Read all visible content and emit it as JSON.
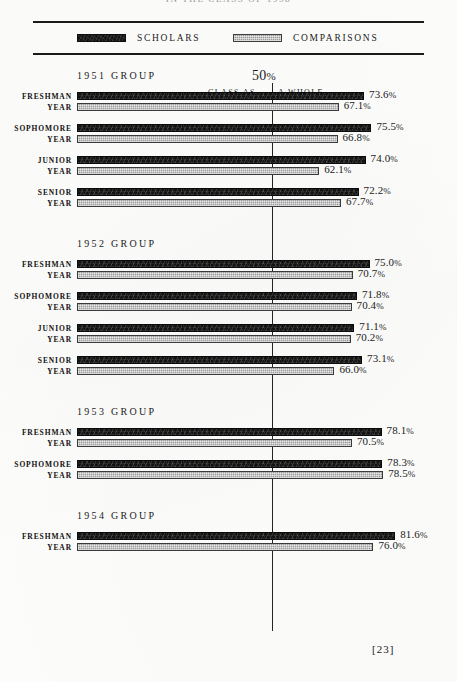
{
  "page": {
    "running_title": "IN THE CLASS OF 1958",
    "folio": "[23]"
  },
  "legend": {
    "scholars_label": "SCHOLARS",
    "comparisons_label": "COMPARISONS",
    "scholars_color": "#131313",
    "comparisons_color": "#9c9c9c"
  },
  "reference": {
    "value_text": "50",
    "percent_sign": "%",
    "left_label": "CLASS AS",
    "right_label": "A WHOLE",
    "value": 50
  },
  "chart_data": {
    "type": "bar",
    "orientation": "horizontal",
    "title": "IN THE CLASS OF 1958",
    "xlabel": "",
    "ylabel": "",
    "xlim": [
      0,
      100
    ],
    "grid": false,
    "legend_position": "top",
    "reference_line": {
      "value": 50,
      "label": "50% CLASS AS A WHOLE"
    },
    "series": [
      {
        "name": "SCHOLARS",
        "color": "#131313"
      },
      {
        "name": "COMPARISONS",
        "color": "#9c9c9c"
      }
    ],
    "groups": [
      {
        "heading": "1951 GROUP",
        "rows": [
          {
            "label_line1": "FRESHMAN",
            "label_line2": "YEAR",
            "scholars": 73.6,
            "comparisons": 67.1,
            "scholars_text": "73.6",
            "comparisons_text": "67.1"
          },
          {
            "label_line1": "SOPHOMORE",
            "label_line2": "YEAR",
            "scholars": 75.5,
            "comparisons": 66.8,
            "scholars_text": "75.5",
            "comparisons_text": "66.8"
          },
          {
            "label_line1": "JUNIOR",
            "label_line2": "YEAR",
            "scholars": 74.0,
            "comparisons": 62.1,
            "scholars_text": "74.0",
            "comparisons_text": "62.1"
          },
          {
            "label_line1": "SENIOR",
            "label_line2": "YEAR",
            "scholars": 72.2,
            "comparisons": 67.7,
            "scholars_text": "72.2",
            "comparisons_text": "67.7"
          }
        ]
      },
      {
        "heading": "1952 GROUP",
        "rows": [
          {
            "label_line1": "FRESHMAN",
            "label_line2": "YEAR",
            "scholars": 75.0,
            "comparisons": 70.7,
            "scholars_text": "75.0",
            "comparisons_text": "70.7"
          },
          {
            "label_line1": "SOPHOMORE",
            "label_line2": "YEAR",
            "scholars": 71.8,
            "comparisons": 70.4,
            "scholars_text": "71.8",
            "comparisons_text": "70.4"
          },
          {
            "label_line1": "JUNIOR",
            "label_line2": "YEAR",
            "scholars": 71.1,
            "comparisons": 70.2,
            "scholars_text": "71.1",
            "comparisons_text": "70.2"
          },
          {
            "label_line1": "SENIOR",
            "label_line2": "YEAR",
            "scholars": 73.1,
            "comparisons": 66.0,
            "scholars_text": "73.1",
            "comparisons_text": "66.0"
          }
        ]
      },
      {
        "heading": "1953 GROUP",
        "rows": [
          {
            "label_line1": "FRESHMAN",
            "label_line2": "YEAR",
            "scholars": 78.1,
            "comparisons": 70.5,
            "scholars_text": "78.1",
            "comparisons_text": "70.5"
          },
          {
            "label_line1": "SOPHOMORE",
            "label_line2": "YEAR",
            "scholars": 78.3,
            "comparisons": 78.5,
            "scholars_text": "78.3",
            "comparisons_text": "78.5"
          }
        ]
      },
      {
        "heading": "1954 GROUP",
        "rows": [
          {
            "label_line1": "FRESHMAN",
            "label_line2": "YEAR",
            "scholars": 81.6,
            "comparisons": 76.0,
            "scholars_text": "81.6",
            "comparisons_text": "76.0"
          }
        ]
      }
    ]
  }
}
